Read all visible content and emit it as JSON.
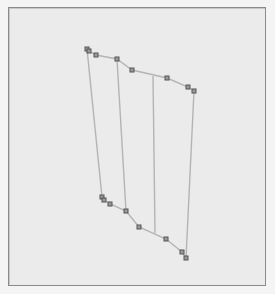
{
  "viewport": {
    "background": "#ebebeb",
    "frame_color": "#8a8a8a"
  },
  "mesh": {
    "edge_color": "#b4b4b4",
    "vertex_color": "#555555",
    "vertex_fill": "#9a9a9a",
    "top_edge": [
      [
        87,
        49
      ],
      [
        89,
        51
      ],
      [
        96,
        55
      ],
      [
        117,
        59
      ],
      [
        132,
        70
      ],
      [
        167,
        78
      ],
      [
        188,
        87
      ],
      [
        194,
        91
      ]
    ],
    "bottom_edge": [
      [
        102,
        197
      ],
      [
        104,
        200
      ],
      [
        110,
        204
      ],
      [
        126,
        211
      ],
      [
        139,
        227
      ],
      [
        166,
        239
      ],
      [
        182,
        252
      ],
      [
        186,
        258
      ]
    ],
    "verticals": [
      [
        [
          87,
          49
        ],
        [
          102,
          197
        ]
      ],
      [
        [
          117,
          59
        ],
        [
          126,
          211
        ]
      ],
      [
        [
          153,
          76
        ],
        [
          155,
          233
        ]
      ],
      [
        [
          194,
          91
        ],
        [
          186,
          258
        ]
      ]
    ],
    "vertices": [
      [
        87,
        49
      ],
      [
        89,
        51
      ],
      [
        96,
        55
      ],
      [
        117,
        59
      ],
      [
        132,
        70
      ],
      [
        167,
        78
      ],
      [
        188,
        87
      ],
      [
        194,
        91
      ],
      [
        102,
        197
      ],
      [
        104,
        200
      ],
      [
        110,
        204
      ],
      [
        126,
        211
      ],
      [
        139,
        227
      ],
      [
        166,
        239
      ],
      [
        182,
        252
      ],
      [
        186,
        258
      ]
    ]
  }
}
